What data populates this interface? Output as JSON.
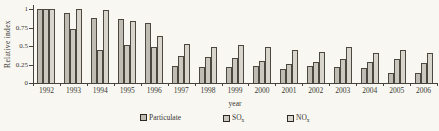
{
  "chart_data": {
    "type": "bar",
    "title": "",
    "xlabel": "year",
    "ylabel": "Relative index",
    "ylim": [
      0,
      1
    ],
    "yticks": [
      0,
      0.25,
      0.5,
      0.75,
      1
    ],
    "ytick_labels": [
      "0",
      "0.25",
      "0.5",
      "0.75",
      "1"
    ],
    "grid": false,
    "legend_position": "bottom",
    "categories": [
      "1992",
      "1993",
      "1994",
      "1995",
      "1996",
      "1997",
      "1998",
      "1999",
      "2000",
      "2001",
      "2002",
      "2003",
      "2004",
      "2005",
      "2006"
    ],
    "series": [
      {
        "name": "Particulate",
        "sub": "",
        "color": "#bfbcb4",
        "values": [
          1.0,
          0.94,
          0.88,
          0.86,
          0.81,
          0.23,
          0.22,
          0.21,
          0.23,
          0.19,
          0.23,
          0.21,
          0.2,
          0.14,
          0.14
        ]
      },
      {
        "name": "SO",
        "sub": "x",
        "color": "#cbc8c0",
        "values": [
          1.0,
          0.73,
          0.44,
          0.51,
          0.48,
          0.37,
          0.35,
          0.34,
          0.3,
          0.25,
          0.28,
          0.33,
          0.29,
          0.33,
          0.27
        ]
      },
      {
        "name": "NO",
        "sub": "x",
        "color": "#d8d5cc",
        "values": [
          1.0,
          1.0,
          0.98,
          0.84,
          0.64,
          0.53,
          0.48,
          0.51,
          0.48,
          0.44,
          0.42,
          0.48,
          0.4,
          0.45,
          0.4
        ]
      }
    ],
    "colors": {
      "axis": "#46433c",
      "bar_border": "#4c4840",
      "background": "#f8f7f2"
    }
  }
}
